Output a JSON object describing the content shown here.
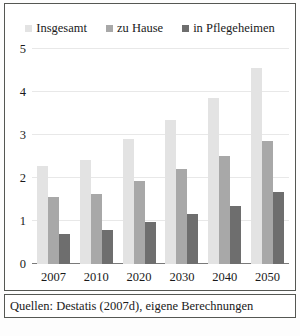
{
  "chart_data": {
    "type": "bar",
    "title": "",
    "subtitle": "",
    "xlabel": "",
    "ylabel": "",
    "categories": [
      "2007",
      "2010",
      "2020",
      "2030",
      "2040",
      "2050"
    ],
    "series": [
      {
        "name": "Insgesamt",
        "color": "#e3e3e3",
        "values": [
          2.28,
          2.42,
          2.9,
          3.35,
          3.87,
          4.55
        ]
      },
      {
        "name": "zu Hause",
        "color": "#a8a8a8",
        "values": [
          1.55,
          1.63,
          1.92,
          2.2,
          2.52,
          2.85
        ]
      },
      {
        "name": "in Pflegeheimen",
        "color": "#6e6e6e",
        "values": [
          0.7,
          0.78,
          0.98,
          1.17,
          1.35,
          1.68
        ]
      }
    ],
    "ylim": [
      0,
      5
    ],
    "yticks": [
      0,
      1,
      2,
      3,
      4,
      5
    ],
    "ytick_labels": [
      "0",
      "1",
      "2",
      "3",
      "4",
      "5"
    ],
    "grid": true,
    "legend_position": "top"
  },
  "legend": {
    "items": [
      {
        "label": "Insgesamt"
      },
      {
        "label": "zu Hause"
      },
      {
        "label": "in Pflegeheimen"
      }
    ]
  },
  "source": {
    "text": "Quellen: Destatis (2007d), eigene Berechnungen"
  },
  "colors": {
    "series_1": "#e3e3e3",
    "series_2": "#a8a8a8",
    "series_3": "#6e6e6e",
    "grid": "#e8e8e8",
    "axis": "#7a7a7a",
    "border": "#555753",
    "text": "#1a1a1a"
  }
}
